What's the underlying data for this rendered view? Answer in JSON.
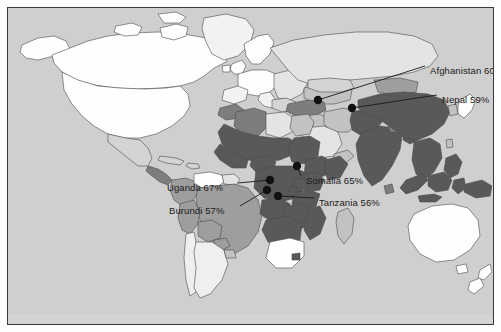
{
  "figure": {
    "type": "choropleth-world-map",
    "frame": {
      "border_color": "#3a3a3a",
      "ocean_color": "#cfcfcf"
    }
  },
  "annotations": [
    {
      "id": "afghanistan",
      "label": "Afghanistan 60%",
      "country": "Afghanistan",
      "value": 60,
      "unit": "%",
      "label_x": 429,
      "label_y": 63,
      "dot_x": 318,
      "dot_y": 100,
      "anchor": "left"
    },
    {
      "id": "nepal",
      "label": "Nepal 59%",
      "country": "Nepal",
      "value": 59,
      "unit": "%",
      "label_x": 441,
      "label_y": 92,
      "dot_x": 352,
      "dot_y": 108,
      "anchor": "left"
    },
    {
      "id": "somalia",
      "label": "Somalia 65%",
      "country": "Somalia",
      "value": 65,
      "unit": "%",
      "label_x": 305,
      "label_y": 173,
      "dot_x": 297,
      "dot_y": 166,
      "anchor": "left"
    },
    {
      "id": "tanzania",
      "label": "Tanzania 56%",
      "country": "Tanzania",
      "value": 56,
      "unit": "%",
      "label_x": 318,
      "label_y": 195,
      "dot_x": 278,
      "dot_y": 196,
      "anchor": "left"
    },
    {
      "id": "uganda",
      "label": "Uganda 67%",
      "country": "Uganda",
      "value": 67,
      "unit": "%",
      "label_x": 166,
      "label_y": 180,
      "dot_x": 270,
      "dot_y": 180,
      "anchor": "right"
    },
    {
      "id": "burundi",
      "label": "Burundi 57%",
      "country": "Burundi",
      "value": 57,
      "unit": "%",
      "label_x": 168,
      "label_y": 203,
      "dot_x": 267,
      "dot_y": 190,
      "anchor": "right"
    }
  ],
  "chart_data": {
    "type": "map",
    "title": "",
    "marker_countries": [
      "Afghanistan",
      "Nepal",
      "Somalia",
      "Tanzania",
      "Uganda",
      "Burundi"
    ],
    "marker_values": [
      60,
      59,
      65,
      56,
      67,
      57
    ],
    "unit": "%",
    "shades": {
      "very_high": "#595959",
      "high": "#7d7d7d",
      "medium": "#9e9e9e",
      "low": "#c2c2c2",
      "very_low": "#e4e4e4",
      "none": "#fefefe",
      "ocean": "#cfcfcf",
      "border": "#4a4a4a"
    }
  }
}
